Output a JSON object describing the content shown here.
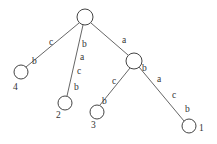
{
  "diagram": {
    "type": "suffix-trie",
    "nodes": [
      {
        "id": "root",
        "label": "",
        "x": 85,
        "y": 17,
        "r": 8
      },
      {
        "id": "internal-a",
        "label": "",
        "x": 134,
        "y": 61,
        "r": 8
      },
      {
        "id": "leaf-4",
        "label": "4",
        "x": 21,
        "y": 72,
        "r": 7
      },
      {
        "id": "leaf-2",
        "label": "2",
        "x": 65,
        "y": 103,
        "r": 7
      },
      {
        "id": "leaf-3",
        "label": "3",
        "x": 97,
        "y": 112,
        "r": 7
      },
      {
        "id": "leaf-1",
        "label": "1",
        "x": 189,
        "y": 126,
        "r": 7
      }
    ],
    "edges": [
      {
        "from": "root",
        "to": "leaf-4",
        "labels": [
          "c",
          "b"
        ]
      },
      {
        "from": "root",
        "to": "leaf-2",
        "labels": [
          "b",
          "a",
          "c",
          "b"
        ]
      },
      {
        "from": "root",
        "to": "internal-a",
        "labels": [
          "a"
        ]
      },
      {
        "from": "internal-a",
        "to": "leaf-3",
        "labels": [
          "c",
          "b"
        ]
      },
      {
        "from": "internal-a",
        "to": "leaf-1",
        "labels": [
          "b",
          "a",
          "c",
          "b"
        ]
      }
    ],
    "edge_label_text": {
      "e_root_4_c": "c",
      "e_root_4_b": "b",
      "e_root_2_b1": "b",
      "e_root_2_a": "a",
      "e_root_2_c": "c",
      "e_root_2_b2": "b",
      "e_root_a_a": "a",
      "e_a_3_c": "c",
      "e_a_3_b": "b",
      "e_a_1_b1": "b",
      "e_a_1_a": "a",
      "e_a_1_c": "c",
      "e_a_1_b2": "b"
    },
    "leaf_labels": {
      "leaf4": "4",
      "leaf2": "2",
      "leaf3": "3",
      "leaf1": "1"
    }
  }
}
